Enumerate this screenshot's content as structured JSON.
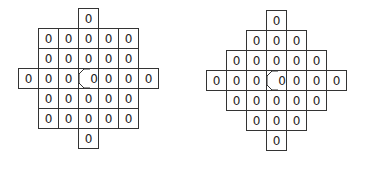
{
  "diagrams": [
    {
      "name": "square-mask",
      "origin": [
        18,
        8
      ],
      "cell_size": 21,
      "rows": [
        {
          "start_col": 3,
          "values": [
            "0"
          ]
        },
        {
          "start_col": 1,
          "values": [
            "0",
            "0",
            "0",
            "0",
            "0"
          ]
        },
        {
          "start_col": 1,
          "values": [
            "0",
            "0",
            "0",
            "0",
            "0"
          ]
        },
        {
          "start_col": 0,
          "values": [
            "0",
            "0",
            "0",
            "0",
            "0",
            "0",
            "0"
          ]
        },
        {
          "start_col": 1,
          "values": [
            "0",
            "0",
            "0",
            "0",
            "0"
          ]
        },
        {
          "start_col": 1,
          "values": [
            "0",
            "0",
            "0",
            "0",
            "0"
          ]
        },
        {
          "start_col": 3,
          "values": [
            "0"
          ]
        }
      ],
      "center": [
        3,
        3
      ]
    },
    {
      "name": "diamond-mask",
      "origin": [
        206,
        10
      ],
      "cell_size": 21,
      "rows": [
        {
          "start_col": 3,
          "values": [
            "0"
          ]
        },
        {
          "start_col": 2,
          "values": [
            "0",
            "0",
            "0"
          ]
        },
        {
          "start_col": 1,
          "values": [
            "0",
            "0",
            "0",
            "0",
            "0"
          ]
        },
        {
          "start_col": 0,
          "values": [
            "0",
            "0",
            "0",
            "0",
            "0",
            "0",
            "0"
          ]
        },
        {
          "start_col": 1,
          "values": [
            "0",
            "0",
            "0",
            "0",
            "0"
          ]
        },
        {
          "start_col": 2,
          "values": [
            "0",
            "0",
            "0"
          ]
        },
        {
          "start_col": 3,
          "values": [
            "0"
          ]
        }
      ],
      "center": [
        3,
        3
      ]
    }
  ]
}
